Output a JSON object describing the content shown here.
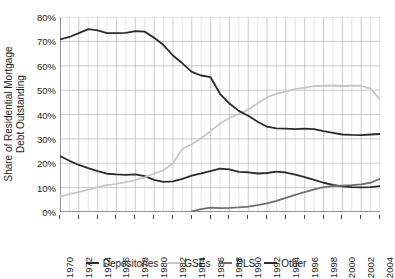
{
  "chart_data": {
    "type": "line",
    "title": "",
    "xlabel": "",
    "ylabel": "Share of Residential Mortgage Debt Outstanding",
    "ylabel_line1": "Share of Residential Mortgage",
    "ylabel_line2": "Debt Outstanding",
    "xlim": [
      1970,
      2004
    ],
    "ylim": [
      0,
      80
    ],
    "ytick_labels": [
      "80%",
      "70%",
      "60%",
      "50%",
      "40%",
      "30%",
      "20%",
      "10%",
      "0%"
    ],
    "ytick_values": [
      80,
      70,
      60,
      50,
      40,
      30,
      20,
      10,
      0
    ],
    "xtick_labels": [
      "1970",
      "1972",
      "1974",
      "1976",
      "1978",
      "1980",
      "1982",
      "1984",
      "1986",
      "1988",
      "1990",
      "1992",
      "1994",
      "1996",
      "1998",
      "2000",
      "2002",
      "2004"
    ],
    "xtick_values": [
      1970,
      1972,
      1974,
      1976,
      1978,
      1980,
      1982,
      1984,
      1986,
      1988,
      1990,
      1992,
      1994,
      1996,
      1998,
      2000,
      2002,
      2004
    ],
    "grid": true,
    "grid_color": "#c8c8c8",
    "legend_position": "bottom",
    "x": [
      1970,
      1971,
      1972,
      1973,
      1974,
      1975,
      1976,
      1977,
      1978,
      1979,
      1980,
      1981,
      1982,
      1983,
      1984,
      1985,
      1986,
      1987,
      1988,
      1989,
      1990,
      1991,
      1992,
      1993,
      1994,
      1995,
      1996,
      1997,
      1998,
      1999,
      2000,
      2001,
      2002,
      2003,
      2004
    ],
    "series": [
      {
        "name": "Depositories",
        "color": "#2b2b2b",
        "values": [
          23.0,
          21.0,
          19.3,
          18.0,
          16.8,
          15.7,
          15.4,
          15.2,
          15.4,
          14.7,
          13.2,
          12.4,
          12.6,
          13.6,
          14.9,
          15.8,
          16.8,
          17.8,
          17.5,
          16.5,
          16.3,
          15.8,
          16.0,
          16.6,
          16.2,
          15.3,
          14.3,
          13.2,
          12.0,
          11.1,
          10.5,
          10.2,
          10.1,
          10.2,
          10.6
        ]
      },
      {
        "name": "GSEs",
        "color": "#c6c6c6",
        "values": [
          6.3,
          7.3,
          8.2,
          9.2,
          10.2,
          11.0,
          11.5,
          12.3,
          13.1,
          14.2,
          15.8,
          17.1,
          20.0,
          25.9,
          27.8,
          30.2,
          33.2,
          36.2,
          38.6,
          40.2,
          42.0,
          44.6,
          47.0,
          48.5,
          49.5,
          50.4,
          51.0,
          51.6,
          51.8,
          51.9,
          51.7,
          51.8,
          51.8,
          50.6,
          46.2
        ]
      },
      {
        "name": "PLS",
        "color": "#6e6e6e",
        "values": [
          null,
          null,
          null,
          null,
          null,
          null,
          null,
          null,
          null,
          null,
          null,
          null,
          null,
          null,
          0.3,
          1.2,
          1.8,
          1.6,
          1.7,
          1.9,
          2.2,
          2.8,
          3.5,
          4.6,
          5.8,
          7.0,
          8.2,
          9.3,
          10.2,
          10.6,
          10.8,
          11.0,
          11.3,
          12.0,
          13.6
        ]
      },
      {
        "name": "Other",
        "color": "#2b2b2b",
        "values": [
          70.8,
          71.8,
          73.4,
          75.0,
          74.5,
          73.4,
          73.4,
          73.5,
          74.2,
          74.0,
          71.5,
          68.5,
          64.2,
          61.0,
          57.5,
          56.0,
          55.3,
          48.5,
          44.5,
          41.5,
          39.5,
          37.0,
          35.0,
          34.3,
          34.2,
          34.0,
          34.2,
          34.0,
          33.2,
          32.5,
          31.8,
          31.6,
          31.5,
          31.8,
          32.0
        ]
      }
    ]
  },
  "legend": {
    "items": [
      {
        "label": "Depositories",
        "color": "#2b2b2b"
      },
      {
        "label": "GSEs",
        "color": "#c6c6c6"
      },
      {
        "label": "PLS",
        "color": "#6e6e6e"
      },
      {
        "label": "Other",
        "color": "#2b2b2b"
      }
    ]
  }
}
